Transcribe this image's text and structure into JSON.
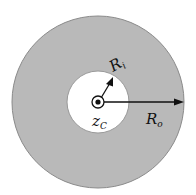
{
  "diagram": {
    "title": "",
    "labels": {
      "inner_radius": "R",
      "inner_radius_sub": "i",
      "outer_radius": "R",
      "outer_radius_sub": "o",
      "center": "z",
      "center_sub": "C"
    },
    "colors": {
      "annulus_fill": "#b9b9b9",
      "annulus_edge": "#8a8a8a",
      "inner_fill": "#ffffff",
      "stroke": "#111111"
    }
  }
}
